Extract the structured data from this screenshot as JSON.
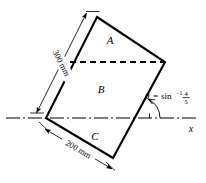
{
  "figure": {
    "regions": [
      {
        "id": "A",
        "label": "A"
      },
      {
        "id": "B",
        "label": "B"
      },
      {
        "id": "C",
        "label": "C"
      }
    ],
    "dimensions": [
      {
        "id": "long-side",
        "label": "300 mm",
        "value": 300,
        "unit": "mm"
      },
      {
        "id": "short-side",
        "label": "200 mm",
        "value": 200,
        "unit": "mm"
      }
    ],
    "angle": {
      "symbol": "θ",
      "equals": "=",
      "function": "sin",
      "exponent": "−1",
      "numerator": "4",
      "denominator": "5",
      "full_label": "θ = sin⁻¹ 4/5"
    },
    "axis": {
      "x_label": "x",
      "style": "dash-dot centerline"
    },
    "colors": {
      "stroke": "#000000",
      "background": "#ffffff",
      "dashed_line": "#000000"
    },
    "geometry": {
      "vertex_top": [
        97,
        17
      ],
      "vertex_right": [
        165,
        62
      ],
      "vertex_left": [
        46,
        118
      ],
      "vertex_bottom": [
        113,
        158
      ],
      "dashed_left": [
        70,
        62
      ],
      "dashed_right": [
        165,
        62
      ]
    }
  }
}
